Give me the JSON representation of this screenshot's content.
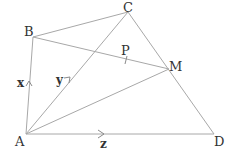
{
  "diagram": {
    "type": "geometry-vectors",
    "points": {
      "A": {
        "label": "A",
        "x": 26,
        "y": 134
      },
      "B": {
        "label": "B",
        "x": 33,
        "y": 37
      },
      "C": {
        "label": "C",
        "x": 128,
        "y": 12
      },
      "D": {
        "label": "D",
        "x": 214,
        "y": 134
      },
      "M": {
        "label": "M",
        "x": 169,
        "y": 69
      },
      "P": {
        "label": "P",
        "x": 126,
        "y": 60
      }
    },
    "edges": [
      [
        "A",
        "B"
      ],
      [
        "B",
        "C"
      ],
      [
        "C",
        "D"
      ],
      [
        "A",
        "D"
      ],
      [
        "A",
        "C"
      ],
      [
        "A",
        "M"
      ],
      [
        "B",
        "M"
      ]
    ],
    "vectors": {
      "x": {
        "label": "x",
        "from": "A",
        "to": "B"
      },
      "y": {
        "label": "y",
        "from": "A",
        "to": "C"
      },
      "z": {
        "label": "z",
        "from": "A",
        "to": "D"
      }
    },
    "tick_mark_on": "BM at P"
  }
}
